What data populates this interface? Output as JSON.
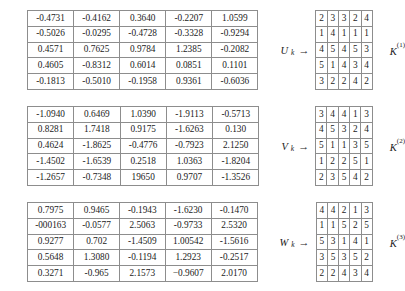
{
  "document": {
    "type": "matrix-figure",
    "blocks": [
      {
        "id": "block-1",
        "source_label": "U",
        "source_subscript": "k",
        "arrow": "→",
        "target_label": "K",
        "target_superscript": "(1)",
        "float_matrix": [
          [
            "-0.4731",
            "-0.4162",
            "0.3640",
            "-0.2207",
            "1.0599"
          ],
          [
            "-0.5026",
            "-0.0295",
            "-0.4728",
            "-0.3328",
            "-0.9294"
          ],
          [
            "0.4571",
            "0.7625",
            "0.9784",
            "1.2385",
            "-0.2082"
          ],
          [
            "0.4605",
            "-0.8312",
            "0.6014",
            "0.0851",
            "0.1101"
          ],
          [
            "-0.1813",
            "-0.5010",
            "-0.1958",
            "0.9361",
            "-0.6036"
          ]
        ],
        "int_matrix": [
          [
            "2",
            "3",
            "3",
            "2",
            "4"
          ],
          [
            "1",
            "4",
            "1",
            "1",
            "1"
          ],
          [
            "4",
            "5",
            "4",
            "5",
            "3"
          ],
          [
            "5",
            "1",
            "4",
            "3",
            "4"
          ],
          [
            "3",
            "2",
            "2",
            "4",
            "2"
          ]
        ]
      },
      {
        "id": "block-2",
        "source_label": "V",
        "source_subscript": "k",
        "arrow": "→",
        "target_label": "K",
        "target_superscript": "(2)",
        "float_matrix": [
          [
            "-1.0940",
            "0.6469",
            "1.0390",
            "-1.9113",
            "-0.5713"
          ],
          [
            "0.8281",
            "1.7418",
            "0.9175",
            "-1.6263",
            "0.130"
          ],
          [
            "0.4624",
            "-1.8625",
            "-0.4776",
            "-0.7923",
            "2.1250"
          ],
          [
            "-1.4502",
            "-1.6539",
            "0.2518",
            "1.0363",
            "-1.8204"
          ],
          [
            "-1.2657",
            "-0.7348",
            "19650",
            "0.9707",
            "-1.3526"
          ]
        ],
        "int_matrix": [
          [
            "3",
            "4",
            "4",
            "1",
            "3"
          ],
          [
            "4",
            "5",
            "3",
            "2",
            "4"
          ],
          [
            "5",
            "1",
            "1",
            "3",
            "5"
          ],
          [
            "1",
            "2",
            "2",
            "5",
            "1"
          ],
          [
            "2",
            "3",
            "5",
            "4",
            "2"
          ]
        ]
      },
      {
        "id": "block-3",
        "source_label": "W",
        "source_subscript": "k",
        "arrow": "→",
        "target_label": "K",
        "target_superscript": "(3)",
        "float_matrix": [
          [
            "0.7975",
            "0.9465",
            "-0.1943",
            "-1.6230",
            "-0.1470"
          ],
          [
            "-000163",
            "-0.0577",
            "2.5063",
            "-0.9733",
            "2.5320"
          ],
          [
            "0.9277",
            "0.702",
            "-1.4509",
            "1.00542",
            "-1.5616"
          ],
          [
            "0.5648",
            "1.3080",
            "-0.1194",
            "1.2923",
            "-0.2517"
          ],
          [
            "0.3271",
            "-0.965",
            "2.1573",
            "−0.9607",
            "2.0170"
          ]
        ],
        "int_matrix": [
          [
            "4",
            "4",
            "2",
            "1",
            "3"
          ],
          [
            "1",
            "1",
            "5",
            "2",
            "5"
          ],
          [
            "5",
            "3",
            "1",
            "4",
            "1"
          ],
          [
            "3",
            "5",
            "3",
            "5",
            "2"
          ],
          [
            "2",
            "2",
            "4",
            "3",
            "4"
          ]
        ]
      }
    ],
    "colors": {
      "border": "#8d8d8d",
      "text": "#1a1a1a",
      "background": "#ffffff"
    }
  }
}
